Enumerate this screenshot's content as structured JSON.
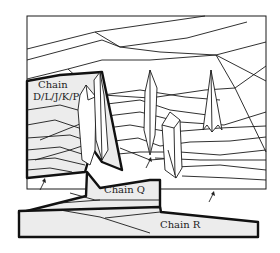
{
  "figure": {
    "type": "crystal-packing-schematic",
    "labels": {
      "chain_dljkp_line1": "Chain",
      "chain_dljkp_line2": "D/L/J/K/P",
      "chain_q": "Chain Q",
      "chain_r": "Chain R"
    },
    "colors": {
      "stroke": "#1a1a1a",
      "highlight_fill": "#ececec",
      "background": "#ffffff"
    },
    "arrows": [
      {
        "name": "arrow-left",
        "x": 44,
        "y": 184
      },
      {
        "name": "arrow-center",
        "x": 148,
        "y": 160
      },
      {
        "name": "arrow-right",
        "x": 213,
        "y": 194
      }
    ]
  }
}
